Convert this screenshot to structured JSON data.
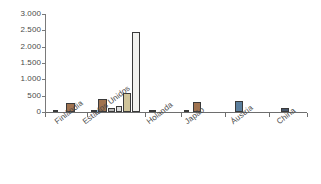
{
  "chart_data": {
    "type": "bar",
    "title": "",
    "subtitle": "",
    "xlabel": "",
    "ylabel": "",
    "grid": false,
    "legend_position": "none",
    "ylim": [
      0,
      3000
    ],
    "yticks": [
      0,
      500,
      1000,
      1500,
      2000,
      2500,
      3000
    ],
    "ytick_labels": [
      "0",
      "500",
      "1.000",
      "1.500",
      "2.000",
      "2.500",
      "3.000"
    ],
    "decimal_separator_note": "thousands separated by period",
    "categories": [
      "Finlândia",
      "Estados Unidos",
      "Holanda",
      "Japão",
      "Áustria",
      "China"
    ],
    "series": [
      {
        "name": "series-1",
        "color": "#c9b79a",
        "values": [
          30,
          40,
          12,
          25,
          10,
          8
        ]
      },
      {
        "name": "series-2",
        "color": "#a07350",
        "values": [
          280,
          395,
          0,
          310,
          0,
          0
        ]
      },
      {
        "name": "series-3",
        "color": "#b8b8b8",
        "values": [
          0,
          110,
          0,
          0,
          0,
          0
        ]
      },
      {
        "name": "series-4",
        "color": "#dcdcdc",
        "values": [
          0,
          175,
          0,
          0,
          0,
          0
        ]
      },
      {
        "name": "series-5",
        "color": "#cfc49a",
        "values": [
          0,
          590,
          0,
          0,
          0,
          0
        ]
      },
      {
        "name": "series-6",
        "color": "#f2f2ef",
        "values": [
          0,
          2450,
          0,
          0,
          0,
          0
        ]
      },
      {
        "name": "series-7",
        "color": "#5b7f9e",
        "values": [
          0,
          0,
          0,
          0,
          340,
          0
        ]
      },
      {
        "name": "series-8",
        "color": "#46566b",
        "values": [
          0,
          0,
          0,
          0,
          0,
          130
        ]
      }
    ],
    "bars": [
      {
        "category": "Finlândia",
        "series": "series-1",
        "value": 30,
        "color": "#c9b79a",
        "x": 8,
        "w": 5
      },
      {
        "category": "Finlândia",
        "series": "series-2",
        "value": 280,
        "color": "#a07350",
        "x": 21,
        "w": 9
      },
      {
        "category": "Estados Unidos",
        "series": "series-1",
        "value": 40,
        "color": "#c9b79a",
        "x": 46,
        "w": 6
      },
      {
        "category": "Estados Unidos",
        "series": "series-2",
        "value": 395,
        "color": "#a07350",
        "x": 53,
        "w": 9
      },
      {
        "category": "Estados Unidos",
        "series": "series-3",
        "value": 110,
        "color": "#b8b8b8",
        "x": 63,
        "w": 7
      },
      {
        "category": "Estados Unidos",
        "series": "series-4",
        "value": 175,
        "color": "#dcdcdc",
        "x": 71,
        "w": 6
      },
      {
        "category": "Estados Unidos",
        "series": "series-5",
        "value": 590,
        "color": "#cfc49a",
        "x": 78,
        "w": 8
      },
      {
        "category": "Estados Unidos",
        "series": "series-6",
        "value": 2450,
        "color": "#f2f2ef",
        "x": 87,
        "w": 8
      },
      {
        "category": "Holanda",
        "series": "series-1",
        "value": 25,
        "color": "#b8b8b8",
        "x": 104,
        "w": 7
      },
      {
        "category": "Japão",
        "series": "series-1",
        "value": 25,
        "color": "#c9b79a",
        "x": 139,
        "w": 5
      },
      {
        "category": "Japão",
        "series": "series-2",
        "value": 310,
        "color": "#a07350",
        "x": 148,
        "w": 8
      },
      {
        "category": "Áustria",
        "series": "series-7",
        "value": 340,
        "color": "#5b7f9e",
        "x": 190,
        "w": 8
      },
      {
        "category": "China",
        "series": "series-8",
        "value": 130,
        "color": "#46566b",
        "x": 236,
        "w": 8
      }
    ],
    "category_boundaries": [
      0,
      42,
      100,
      136,
      180,
      224,
      262
    ]
  }
}
